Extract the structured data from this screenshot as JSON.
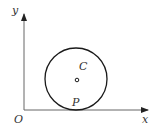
{
  "diagram": {
    "type": "coordinate-geometry",
    "axes": {
      "x_label": "x",
      "y_label": "y",
      "origin_label": "O"
    },
    "circle": {
      "center_label": "C",
      "tangent_point_label": "P",
      "description": "Circle tangent to the x-axis at point P, with center C marked"
    },
    "colors": {
      "stroke": "#1a1a1a",
      "axis": "#555555",
      "text": "#333333",
      "background": "#ffffff"
    }
  }
}
